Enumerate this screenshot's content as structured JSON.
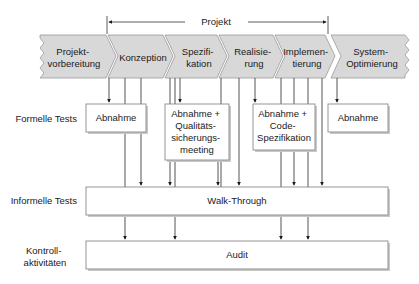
{
  "project_bracket": {
    "label": "Projekt"
  },
  "phases": [
    {
      "id": "projektvorbereitung",
      "lines": [
        "Projekt-",
        "vorbereitung"
      ]
    },
    {
      "id": "konzeption",
      "lines": [
        "Konzeption"
      ]
    },
    {
      "id": "spezifikation",
      "lines": [
        "Spezifi-",
        "kation"
      ]
    },
    {
      "id": "realisierung",
      "lines": [
        "Realisie-",
        "rung"
      ]
    },
    {
      "id": "implementierung",
      "lines": [
        "Implemen-",
        "tierung"
      ]
    },
    {
      "id": "system-optimierung",
      "lines": [
        "System-",
        "Optimierung"
      ]
    }
  ],
  "rows": {
    "formal": {
      "label": "Formelle Tests"
    },
    "informal": {
      "label": "Informelle Tests"
    },
    "control": {
      "lines": [
        "Kontroll-",
        "aktivitäten"
      ]
    }
  },
  "formal_boxes": [
    {
      "id": "abnahme-1",
      "lines": [
        "Abnahme"
      ]
    },
    {
      "id": "abnahme-qs",
      "lines": [
        "Abnahme +",
        "Qualitäts-",
        "sicherungs-",
        "meeting"
      ]
    },
    {
      "id": "abnahme-code",
      "lines": [
        "Abnahme +",
        "Code-",
        "Spezifikation"
      ]
    },
    {
      "id": "abnahme-2",
      "lines": [
        "Abnahme"
      ]
    }
  ],
  "informal_box": {
    "label": "Walk-Through"
  },
  "control_box": {
    "label": "Audit"
  },
  "colors": {
    "chevron_fill": "#d8d8d8",
    "box_border": "#8a8a8a",
    "line": "#2a2a2a",
    "text": "#1a1a1a"
  }
}
